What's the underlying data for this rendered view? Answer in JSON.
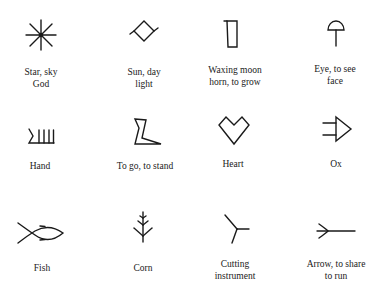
{
  "figure": {
    "title": "",
    "signs": [
      {
        "glyph": "star-icon",
        "label_line1": "Star, sky",
        "label_line2": "God"
      },
      {
        "glyph": "sun-diamond-icon",
        "label_line1": "Sun, day",
        "label_line2": "light"
      },
      {
        "glyph": "moon-rectangle-icon",
        "label_line1": "Waxing moon",
        "label_line2": "horn, to grow"
      },
      {
        "glyph": "eye-dome-icon",
        "label_line1": "Eye, to see",
        "label_line2": "face"
      },
      {
        "glyph": "hand-comb-icon",
        "label_line1": "Hand",
        "label_line2": ""
      },
      {
        "glyph": "foot-icon",
        "label_line1": "To go, to stand",
        "label_line2": ""
      },
      {
        "glyph": "heart-icon",
        "label_line1": "Heart",
        "label_line2": ""
      },
      {
        "glyph": "ox-icon",
        "label_line1": "Ox",
        "label_line2": ""
      },
      {
        "glyph": "fish-icon",
        "label_line1": "Fish",
        "label_line2": ""
      },
      {
        "glyph": "corn-icon",
        "label_line1": "Corn",
        "label_line2": ""
      },
      {
        "glyph": "cutting-instrument-icon",
        "label_line1": "Cutting",
        "label_line2": "instrument"
      },
      {
        "glyph": "arrow-icon",
        "label_line1": "Arrow, to share",
        "label_line2": "to run"
      }
    ]
  }
}
